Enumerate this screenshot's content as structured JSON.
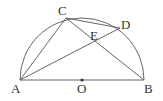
{
  "diagram": {
    "type": "geometry",
    "colors": {
      "stroke": "#555555",
      "text": "#333333",
      "background": "#ffffff"
    },
    "points": {
      "A": {
        "label": "A",
        "x": 20,
        "y": 80
      },
      "B": {
        "label": "B",
        "x": 144,
        "y": 80
      },
      "O": {
        "label": "O",
        "x": 82,
        "y": 80
      },
      "C": {
        "label": "C",
        "x": 66,
        "y": 18
      },
      "D": {
        "label": "D",
        "x": 120,
        "y": 28
      },
      "E": {
        "label": "E",
        "x": 96,
        "y": 41
      }
    },
    "segments": [
      "AB",
      "AC",
      "AD",
      "CB",
      "CD"
    ],
    "arc": {
      "center": "O",
      "from": "A",
      "to": "B"
    }
  }
}
